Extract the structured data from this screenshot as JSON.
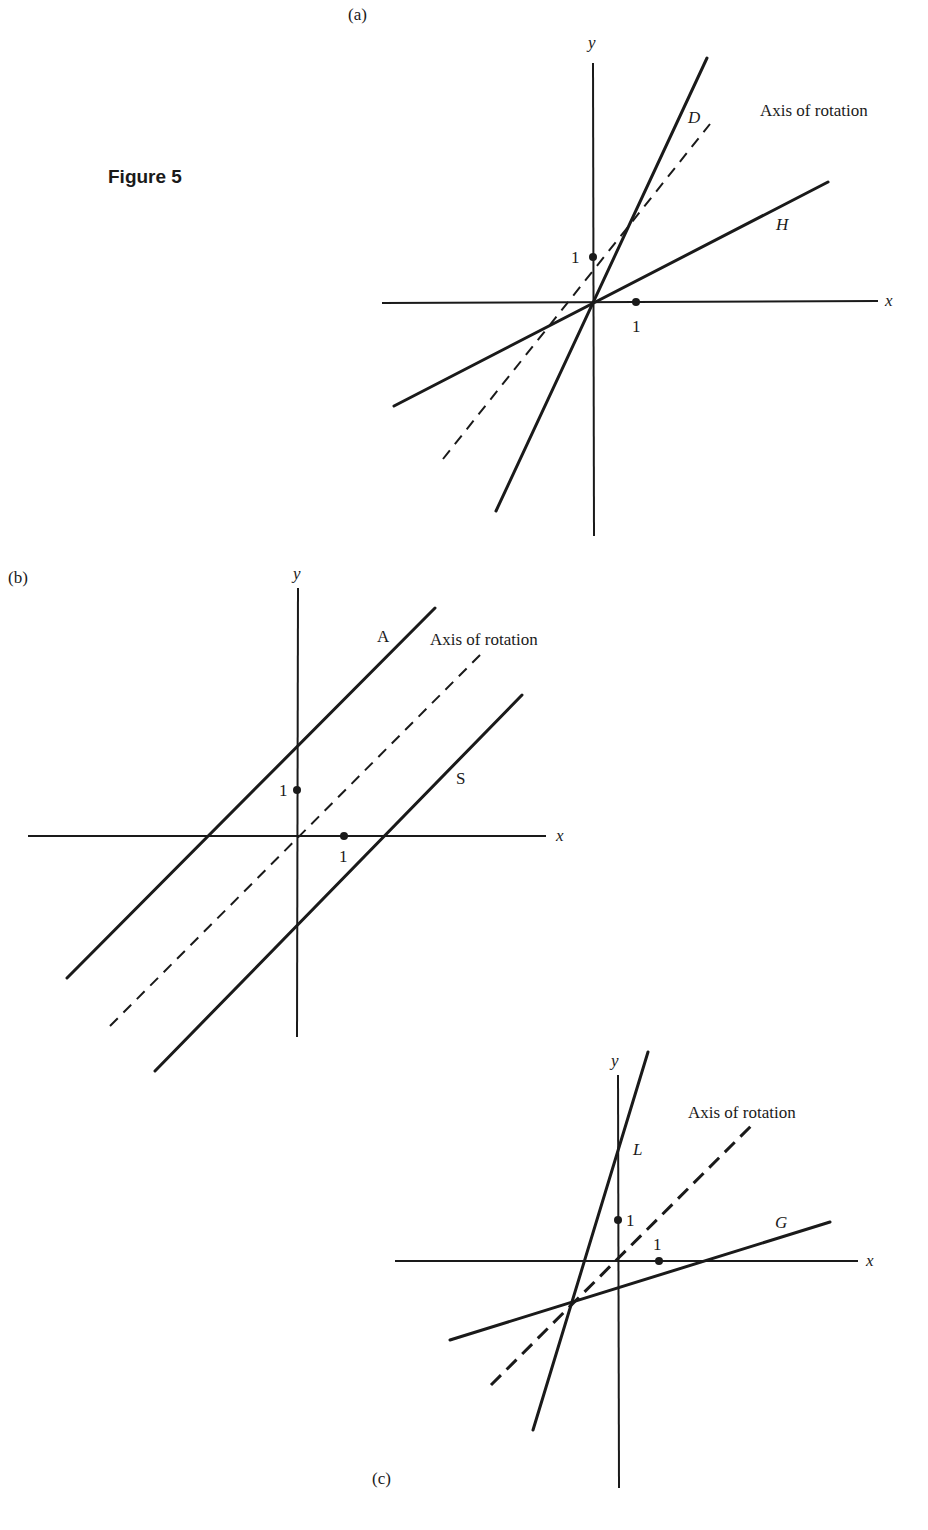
{
  "figure": {
    "title": "Figure 5",
    "title_pos": [
      108,
      183
    ]
  },
  "panels": [
    {
      "id": "a",
      "label": "(a)",
      "label_pos": [
        348,
        20
      ],
      "axes": {
        "x": {
          "from": [
            382,
            303
          ],
          "to": [
            878,
            301
          ],
          "label": "x",
          "label_pos": [
            885,
            306
          ]
        },
        "y": {
          "from": [
            593,
            63
          ],
          "to": [
            594,
            536
          ],
          "label": "y",
          "label_pos": [
            588,
            48
          ]
        }
      },
      "ticks": [
        {
          "axis": "y",
          "pos": [
            593,
            257
          ],
          "label": "1",
          "label_pos": [
            571,
            263
          ]
        },
        {
          "axis": "x",
          "pos": [
            636,
            302
          ],
          "label": "1",
          "label_pos": [
            632,
            332
          ]
        }
      ],
      "lines": [
        {
          "name": "D",
          "style": "solid",
          "from": [
            496,
            511
          ],
          "to": [
            707,
            58
          ],
          "label": "D",
          "label_pos": [
            688,
            123
          ],
          "italic": true
        },
        {
          "name": "H",
          "style": "solid",
          "from": [
            394,
            406
          ],
          "to": [
            828,
            182
          ],
          "label": "H",
          "label_pos": [
            776,
            230
          ],
          "italic": true
        },
        {
          "name": "Axis of rotation",
          "style": "dashed",
          "from": [
            443,
            459
          ],
          "to": [
            710,
            124
          ],
          "label": "Axis of rotation",
          "label_pos": [
            760,
            116
          ],
          "italic": false
        }
      ]
    },
    {
      "id": "b",
      "label": "(b)",
      "label_pos": [
        8,
        583
      ],
      "axes": {
        "x": {
          "from": [
            28,
            836
          ],
          "to": [
            546,
            836
          ],
          "label": "x",
          "label_pos": [
            556,
            841
          ]
        },
        "y": {
          "from": [
            298,
            588
          ],
          "to": [
            297,
            1037
          ],
          "label": "y",
          "label_pos": [
            293,
            579
          ]
        },
        "y_label_note": "y"
      },
      "ticks": [
        {
          "axis": "y",
          "pos": [
            297,
            790
          ],
          "label": "1",
          "label_pos": [
            279,
            796
          ]
        },
        {
          "axis": "x",
          "pos": [
            344,
            836
          ],
          "label": "1",
          "label_pos": [
            339,
            862
          ]
        }
      ],
      "lines": [
        {
          "name": "A",
          "style": "solid",
          "from": [
            67,
            978
          ],
          "to": [
            435,
            608
          ],
          "label": "A",
          "label_pos": [
            377,
            642
          ],
          "italic": false
        },
        {
          "name": "S",
          "style": "solid",
          "from": [
            155,
            1071
          ],
          "to": [
            522,
            695
          ],
          "label": "S",
          "label_pos": [
            456,
            784
          ],
          "italic": false
        },
        {
          "name": "Axis of rotation",
          "style": "dashed",
          "from": [
            110,
            1026
          ],
          "to": [
            484,
            651
          ],
          "label": "Axis of rotation",
          "label_pos": [
            430,
            645
          ],
          "italic": false
        }
      ]
    },
    {
      "id": "c",
      "label": "(c)",
      "label_pos": [
        372,
        1484
      ],
      "axes": {
        "x": {
          "from": [
            395,
            1261
          ],
          "to": [
            858,
            1261
          ],
          "label": "x",
          "label_pos": [
            866,
            1266
          ]
        },
        "y": {
          "from": [
            618,
            1075
          ],
          "to": [
            619,
            1488
          ],
          "label": "y",
          "label_pos": [
            611,
            1066
          ]
        }
      },
      "ticks": [
        {
          "axis": "y",
          "pos": [
            618,
            1220
          ],
          "label": "1",
          "label_pos": [
            626,
            1226
          ]
        },
        {
          "axis": "x",
          "pos": [
            659,
            1261
          ],
          "label": "1",
          "label_pos": [
            653,
            1250
          ]
        }
      ],
      "lines": [
        {
          "name": "L",
          "style": "solid",
          "from": [
            533,
            1430
          ],
          "to": [
            648,
            1052
          ],
          "label": "L",
          "label_pos": [
            633,
            1155
          ],
          "italic": true
        },
        {
          "name": "G",
          "style": "solid",
          "from": [
            450,
            1340
          ],
          "to": [
            830,
            1222
          ],
          "label": "G",
          "label_pos": [
            775,
            1228
          ],
          "italic": true
        },
        {
          "name": "Axis of rotation",
          "style": "dashed-bold",
          "from": [
            491,
            1385
          ],
          "to": [
            751,
            1126
          ],
          "label": "Axis of rotation",
          "label_pos": [
            688,
            1118
          ],
          "italic": false
        }
      ]
    }
  ]
}
